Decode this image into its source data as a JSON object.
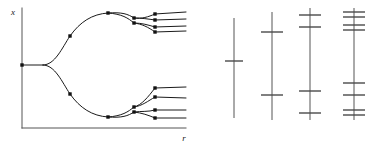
{
  "figure": {
    "title": "",
    "axes": {
      "ylabel": "x",
      "xlabel": "r"
    },
    "colors": {
      "curve": "#1a1a1a",
      "axis": "#555555",
      "dot": "#111111",
      "tick": "#4a4a4a",
      "background": "#ffffff"
    }
  },
  "chart_data": {
    "type": "line",
    "xlabel": "r",
    "ylabel": "x",
    "xlim": [
      0,
      190
    ],
    "ylim": [
      0,
      164
    ],
    "grid": false,
    "legend": null,
    "axis_lines": {
      "y_axis": {
        "x": 22,
        "y_top": 8,
        "y_bottom": 128
      },
      "x_axis": {
        "y": 128,
        "x_left": 22,
        "x_right": 186
      }
    },
    "branch_paths": [
      "M22,65 L43,65",
      "M43,65 C55,65 62,48 70,36 C80,22 92,14 108,13",
      "M43,65 C55,65 62,82 70,94 C80,108 92,116 108,117",
      "M108,13 C122,12 128,14 134,18",
      "M108,13 C122,14 128,18 134,23",
      "M108,117 C122,118 128,116 134,112",
      "M108,117 C122,116 128,112 134,107",
      "M134,18 C142,19 148,17 155,14",
      "M134,18 C142,18 148,19 155,20",
      "M134,23 C142,23 148,25 155,27",
      "M134,23 C142,24 148,27 155,32",
      "M134,112 C142,111 148,112 155,110",
      "M134,112 C142,113 148,115 155,118",
      "M134,107 C142,106 148,101 155,97",
      "M134,107 C142,105 148,97 155,88",
      "M155,14 L186,12",
      "M155,20 L186,19",
      "M155,27 L186,26",
      "M155,32 L186,31",
      "M155,88 L186,87",
      "M155,97 L186,98",
      "M155,110 L186,110",
      "M155,118 L186,118"
    ],
    "markers": [
      {
        "x": 22,
        "y": 65,
        "period": 1
      },
      {
        "x": 70,
        "y": 36,
        "period": 2
      },
      {
        "x": 70,
        "y": 94,
        "period": 2
      },
      {
        "x": 108,
        "y": 13,
        "period": 4
      },
      {
        "x": 108,
        "y": 117,
        "period": 4
      },
      {
        "x": 134,
        "y": 18,
        "period": 4
      },
      {
        "x": 134,
        "y": 23,
        "period": 4
      },
      {
        "x": 134,
        "y": 107,
        "period": 4
      },
      {
        "x": 134,
        "y": 112,
        "period": 4
      },
      {
        "x": 155,
        "y": 14,
        "period": 8
      },
      {
        "x": 155,
        "y": 20,
        "period": 8
      },
      {
        "x": 155,
        "y": 27,
        "period": 8
      },
      {
        "x": 155,
        "y": 32,
        "period": 8
      },
      {
        "x": 155,
        "y": 88,
        "period": 8
      },
      {
        "x": 155,
        "y": 97,
        "period": 8
      },
      {
        "x": 155,
        "y": 110,
        "period": 8
      },
      {
        "x": 155,
        "y": 118,
        "period": 8
      }
    ],
    "attractor_panels": [
      {
        "label": "period-1",
        "line_x": 234,
        "y_top": 18,
        "y_bottom": 118,
        "tick_half_width": 9,
        "ticks": [
          61
        ]
      },
      {
        "label": "period-2",
        "line_x": 272,
        "y_top": 12,
        "y_bottom": 120,
        "tick_half_width": 11,
        "ticks": [
          32,
          95
        ]
      },
      {
        "label": "period-4",
        "line_x": 310,
        "y_top": 8,
        "y_bottom": 120,
        "tick_half_width": 11,
        "ticks": [
          15,
          27,
          91,
          113
        ]
      },
      {
        "label": "period-8",
        "line_x": 354,
        "y_top": 8,
        "y_bottom": 120,
        "tick_half_width": 11,
        "ticks": [
          12,
          17,
          25,
          30,
          83,
          95,
          110,
          115
        ]
      }
    ]
  }
}
